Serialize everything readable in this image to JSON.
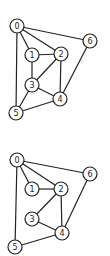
{
  "graphs": [
    {
      "name": "graph-top",
      "nodes": [
        {
          "id": "0",
          "x": 17,
          "y": 26
        },
        {
          "id": "1",
          "x": 32,
          "y": 55
        },
        {
          "id": "2",
          "x": 61,
          "y": 54
        },
        {
          "id": "3",
          "x": 32,
          "y": 85
        },
        {
          "id": "4",
          "x": 60,
          "y": 99
        },
        {
          "id": "5",
          "x": 16,
          "y": 113
        },
        {
          "id": "6",
          "x": 90,
          "y": 41
        }
      ],
      "edges": [
        [
          "0",
          "1"
        ],
        [
          "0",
          "2"
        ],
        [
          "0",
          "6"
        ],
        [
          "0",
          "5"
        ],
        [
          "1",
          "2"
        ],
        [
          "1",
          "3"
        ],
        [
          "2",
          "3"
        ],
        [
          "2",
          "4"
        ],
        [
          "3",
          "4"
        ],
        [
          "3",
          "5"
        ],
        [
          "5",
          "4"
        ],
        [
          "6",
          "4"
        ]
      ]
    },
    {
      "name": "graph-bottom",
      "nodes": [
        {
          "id": "0",
          "x": 17,
          "y": 160
        },
        {
          "id": "1",
          "x": 32,
          "y": 189
        },
        {
          "id": "2",
          "x": 61,
          "y": 189
        },
        {
          "id": "3",
          "x": 32,
          "y": 219
        },
        {
          "id": "4",
          "x": 62,
          "y": 233
        },
        {
          "id": "5",
          "x": 15,
          "y": 247
        },
        {
          "id": "6",
          "x": 90,
          "y": 174
        }
      ],
      "edges": [
        [
          "0",
          "1"
        ],
        [
          "0",
          "2"
        ],
        [
          "0",
          "6"
        ],
        [
          "0",
          "5"
        ],
        [
          "1",
          "2"
        ],
        [
          "2",
          "3"
        ],
        [
          "2",
          "4"
        ],
        [
          "3",
          "4"
        ],
        [
          "5",
          "4"
        ],
        [
          "6",
          "4"
        ]
      ]
    }
  ],
  "style": {
    "node_radius": 7,
    "stroke": "#222222",
    "fill": "#ffffff"
  }
}
